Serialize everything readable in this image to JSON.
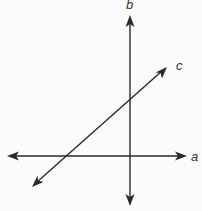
{
  "diagram": {
    "type": "line-intersection",
    "lines": [
      {
        "name": "a",
        "label": "a",
        "orientation": "horizontal"
      },
      {
        "name": "b",
        "label": "b",
        "orientation": "vertical"
      },
      {
        "name": "c",
        "label": "c",
        "orientation": "diagonal-transversal"
      }
    ],
    "colors": {
      "line": "#2a2a2a",
      "background": "#fbfbfb"
    }
  }
}
